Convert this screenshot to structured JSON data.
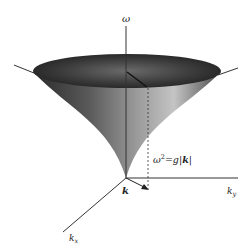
{
  "diagram": {
    "type": "3d-dispersion-surface",
    "axes": {
      "vertical": {
        "label": "ω"
      },
      "kx": {
        "label": "k",
        "subscript": "x"
      },
      "ky": {
        "label": "k",
        "subscript": "y"
      }
    },
    "vector_label": "k",
    "relation": {
      "lhs": "ω",
      "sup": "2",
      "eq": "=g|",
      "bold": "k",
      "end": "|"
    },
    "colors": {
      "axis": "#333333",
      "surface_dark": "#1a1a1a",
      "surface_light": "#b8b8b8",
      "background": "#ffffff"
    }
  }
}
